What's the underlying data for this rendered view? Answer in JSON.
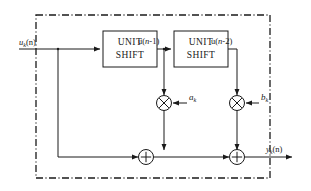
{
  "diagram": {
    "type": "block-diagram",
    "boundary": {
      "style": "dash-dot",
      "color": "#1a1a1a"
    },
    "input": {
      "label": "u",
      "label_sub": "k",
      "label_tail": "(n)",
      "full": "u_k(n)"
    },
    "output": {
      "label": "y",
      "label_sub": "k",
      "label_tail": "(n)",
      "full": "y_k(n)"
    },
    "blocks": [
      {
        "id": "unit-shift-1",
        "line1": "UNIT",
        "line2": "SHIFT"
      },
      {
        "id": "unit-shift-2",
        "line1": "UNIT",
        "line2": "SHIFT"
      }
    ],
    "signals": [
      {
        "id": "sig-un1",
        "prefix": "u(",
        "var": "n",
        "suffix": "-1)",
        "full": "u(n-1)"
      },
      {
        "id": "sig-un2",
        "prefix": "u(",
        "var": "n",
        "suffix": "-2)",
        "full": "u(n-2)"
      }
    ],
    "multipliers": [
      {
        "id": "mult-a",
        "symbol": "⊗",
        "coef": "a",
        "coef_sub": "k",
        "full": "a_k"
      },
      {
        "id": "mult-b",
        "symbol": "⊗",
        "coef": "b",
        "coef_sub": "k",
        "full": "b_k"
      }
    ],
    "adders": [
      {
        "id": "adder-1",
        "symbol": "⊕"
      },
      {
        "id": "adder-2",
        "symbol": "⊕"
      }
    ]
  }
}
